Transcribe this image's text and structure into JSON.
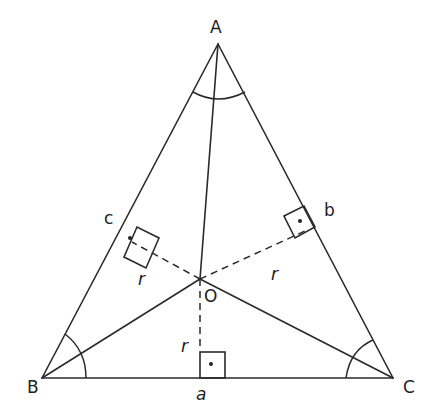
{
  "diagram": {
    "vertices": {
      "A": {
        "label": "A",
        "x": 218,
        "y": 44
      },
      "B": {
        "label": "B",
        "x": 42,
        "y": 378
      },
      "C": {
        "label": "C",
        "x": 393,
        "y": 378
      }
    },
    "incenter": {
      "label": "O",
      "x": 200,
      "y": 279
    },
    "sides": {
      "a": {
        "label": "a"
      },
      "b": {
        "label": "b"
      },
      "c": {
        "label": "c"
      }
    },
    "radius_labels": {
      "left": "r",
      "right": "r",
      "bottom": "r"
    },
    "colors": {
      "stroke": "#2a2a2a",
      "text": "#222222",
      "background": "#ffffff"
    }
  }
}
